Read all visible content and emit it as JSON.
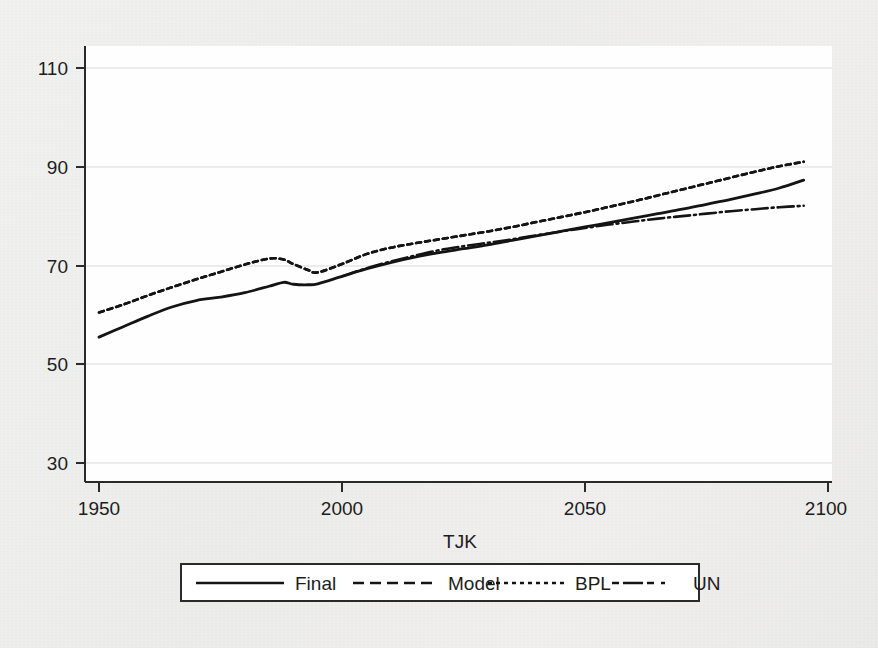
{
  "chart_data": {
    "type": "line",
    "title": "",
    "xlabel": "TJK",
    "ylabel": "",
    "xlim": [
      1950,
      2100
    ],
    "ylim": [
      30,
      110
    ],
    "xticks": [
      1950,
      2000,
      2050,
      2100
    ],
    "yticks": [
      30,
      50,
      70,
      90,
      110
    ],
    "grid": true,
    "legend_position": "below-axis",
    "series": [
      {
        "name": "Final",
        "style": "solid",
        "x": [
          1950,
          1955,
          1960,
          1965,
          1970,
          1975,
          1980,
          1985,
          1988,
          1990,
          1993,
          1995,
          2000,
          2005,
          2010,
          2015,
          2020,
          2025,
          2030,
          2035,
          2040,
          2045,
          2050,
          2055,
          2060,
          2065,
          2070,
          2075,
          2080,
          2085,
          2090,
          2095
        ],
        "values": [
          55.5,
          57.6,
          59.7,
          61.6,
          62.9,
          63.6,
          64.5,
          65.8,
          66.6,
          66.2,
          66.1,
          66.3,
          67.8,
          69.3,
          70.6,
          71.7,
          72.6,
          73.4,
          74.2,
          75.1,
          76.0,
          76.9,
          77.8,
          78.7,
          79.6,
          80.5,
          81.4,
          82.4,
          83.4,
          84.5,
          85.7,
          87.3
        ],
        "endpoint_value": 87.3
      },
      {
        "name": "Model",
        "style": "dashed",
        "x": [
          1950,
          1955,
          1960,
          1965,
          1970,
          1975,
          1980,
          1985,
          1988,
          1990,
          1993,
          1995,
          2000,
          2005,
          2010,
          2015,
          2020,
          2025,
          2030,
          2035,
          2040,
          2045,
          2050,
          2055,
          2060,
          2065,
          2070,
          2075,
          2080,
          2085,
          2090,
          2095
        ],
        "values": [
          60.5,
          62.1,
          63.9,
          65.6,
          67.2,
          68.7,
          70.2,
          71.4,
          71.2,
          70.3,
          69.1,
          68.6,
          70.3,
          72.3,
          73.6,
          74.5,
          75.3,
          76.1,
          76.9,
          77.8,
          78.8,
          79.8,
          80.8,
          81.9,
          83.0,
          84.2,
          85.4,
          86.6,
          87.8,
          89.0,
          90.1,
          91.0
        ],
        "endpoint_value": 91.0
      },
      {
        "name": "BPL",
        "style": "dotted",
        "x": [
          1950,
          1955,
          1960,
          1965,
          1970,
          1975,
          1980,
          1985,
          1988,
          1990,
          1993,
          1995,
          2000,
          2005,
          2010,
          2015,
          2020,
          2025,
          2030,
          2035,
          2040,
          2045,
          2050,
          2055,
          2060,
          2065,
          2070,
          2075,
          2080,
          2085,
          2090,
          2095
        ],
        "values": [
          60.5,
          62.1,
          63.9,
          65.6,
          67.2,
          68.7,
          70.2,
          71.4,
          71.2,
          70.3,
          69.1,
          68.6,
          70.3,
          72.3,
          73.6,
          74.5,
          75.3,
          76.1,
          76.9,
          77.8,
          78.8,
          79.8,
          80.8,
          81.9,
          83.0,
          84.2,
          85.4,
          86.6,
          87.8,
          89.0,
          90.1,
          91.0
        ],
        "endpoint_value": 91.0
      },
      {
        "name": "UN",
        "style": "dashdot",
        "x": [
          2000,
          2005,
          2010,
          2015,
          2020,
          2025,
          2030,
          2035,
          2040,
          2045,
          2050,
          2055,
          2060,
          2065,
          2070,
          2075,
          2080,
          2085,
          2090,
          2095
        ],
        "values": [
          67.8,
          69.4,
          70.8,
          72.0,
          73.1,
          73.9,
          74.6,
          75.3,
          76.1,
          76.9,
          77.6,
          78.3,
          78.9,
          79.5,
          80.0,
          80.5,
          81.0,
          81.4,
          81.8,
          82.1
        ],
        "endpoint_value": 82.1
      }
    ]
  },
  "axes": {
    "y_tick_labels": [
      "110",
      "90",
      "70",
      "50",
      "30"
    ],
    "x_tick_labels": [
      "1950",
      "2000",
      "2050",
      "2100"
    ],
    "x_axis_title": "TJK"
  },
  "legend": {
    "entries": [
      {
        "label": "Final",
        "style": "solid"
      },
      {
        "label": "Model",
        "style": "dashed"
      },
      {
        "label": "BPL",
        "style": "dotted"
      },
      {
        "label": "UN",
        "style": "dashdot"
      }
    ]
  },
  "colors": {
    "line": "#141414",
    "grid": "#d8d8d8",
    "axis": "#2a2a2a",
    "plot_background": "#fefefe",
    "page_background": "#f0efed",
    "text": "#1d1d1d"
  }
}
